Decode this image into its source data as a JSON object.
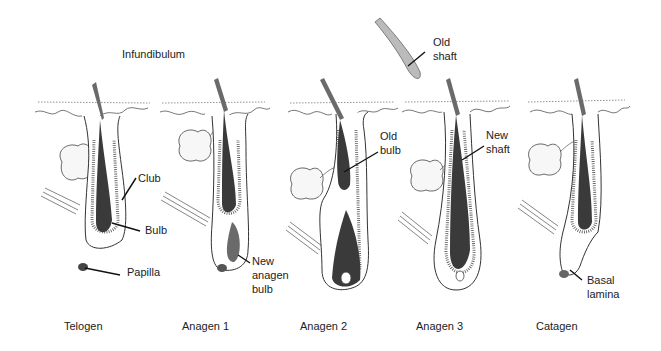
{
  "diagram": {
    "title_label": "Infundibulum",
    "floating_label": {
      "line1": "Old",
      "line2": "shaft"
    },
    "stages": [
      {
        "id": "telogen",
        "caption": "Telogen",
        "annotations": [
          {
            "text": "Club"
          },
          {
            "text": "Bulb"
          },
          {
            "text": "Papilla"
          }
        ]
      },
      {
        "id": "anagen1",
        "caption": "Anagen 1",
        "annotations": [
          {
            "lines": [
              "New",
              "anagen",
              "bulb"
            ]
          }
        ]
      },
      {
        "id": "anagen2",
        "caption": "Anagen 2",
        "annotations": [
          {
            "lines": [
              "Old",
              "bulb"
            ]
          }
        ]
      },
      {
        "id": "anagen3",
        "caption": "Anagen 3",
        "annotations": [
          {
            "lines": [
              "New",
              "shaft"
            ]
          }
        ]
      },
      {
        "id": "catagen",
        "caption": "Catagen",
        "annotations": [
          {
            "lines": [
              "Basal",
              "lamina"
            ]
          }
        ]
      }
    ]
  }
}
